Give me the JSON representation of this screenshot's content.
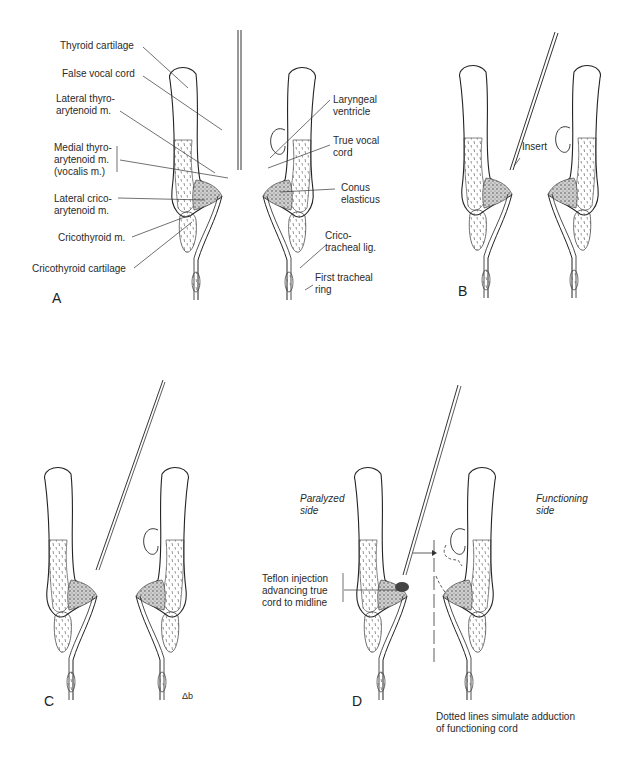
{
  "figure": {
    "panels": [
      {
        "id": "A",
        "letter": "A"
      },
      {
        "id": "B",
        "letter": "B"
      },
      {
        "id": "C",
        "letter": "C"
      },
      {
        "id": "D",
        "letter": "D"
      }
    ]
  },
  "panel_a": {
    "left_labels": {
      "thyroid_cartilage": "Thyroid cartilage",
      "false_vocal_cord": "False vocal cord",
      "lateral_thyro_1": "Lateral thyro-",
      "lateral_thyro_2": "arytenoid m.",
      "medial_thyro_1": "Medial thyro-",
      "medial_thyro_2": "arytenoid m.",
      "medial_thyro_3": "(vocalis m.)",
      "lateral_crico_1": "Lateral crico-",
      "lateral_crico_2": "arytenoid m.",
      "cricothyroid_m": "Cricothyroid m.",
      "cricothyroid_cartilage": "Cricothyroid cartilage"
    },
    "right_labels": {
      "laryngeal_1": "Laryngeal",
      "laryngeal_2": "ventricle",
      "true_vocal_1": "True vocal",
      "true_vocal_2": "cord",
      "conus_1": "Conus",
      "conus_2": "elasticus",
      "crico_tracheal_1": "Crico-",
      "crico_tracheal_2": "tracheal lig.",
      "first_tracheal_1": "First tracheal",
      "first_tracheal_2": "ring"
    }
  },
  "panel_b": {
    "insert_label": "Insert"
  },
  "panel_c": {
    "signature": "Δb"
  },
  "panel_d": {
    "paralyzed_1": "Paralyzed",
    "paralyzed_2": "side",
    "functioning_1": "Functioning",
    "functioning_2": "side",
    "teflon_1": "Teflon injection",
    "teflon_2": "advancing true",
    "teflon_3": "cord to midline",
    "caption_1": "Dotted lines simulate adduction",
    "caption_2": "of functioning cord"
  }
}
